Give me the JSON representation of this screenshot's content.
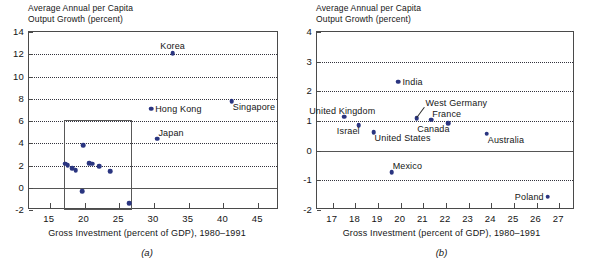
{
  "figure": {
    "ylabel": "Average Annual per Capita\nOutput Growth (percent)",
    "xlabel": "Gross Investment (percent of GDP), 1980–1991",
    "dot_color": "#2a3580",
    "frame_color": "#4a4a4a"
  },
  "panel_a": {
    "caption": "(a)",
    "ylabel": "Average Annual per Capita\nOutput Growth (percent)",
    "xlabel": "Gross Investment (percent of GDP), 1980–1991",
    "yticks": [
      14,
      12,
      10,
      8,
      6,
      4,
      2,
      0,
      -2
    ],
    "ytick_labels": [
      "14",
      "12",
      "10",
      "8",
      "6",
      "4",
      "2",
      "0",
      "-2"
    ],
    "xticks": [
      15,
      20,
      25,
      30,
      35,
      40,
      45
    ],
    "xtick_labels": [
      "15",
      "20",
      "25",
      "30",
      "35",
      "40",
      "45"
    ],
    "labels": [
      "Korea",
      "Hong Kong",
      "Singapore",
      "Japan"
    ]
  },
  "panel_b": {
    "caption": "(b)",
    "ylabel": "Average Annual per Capita\nOutput Growth (percent)",
    "xlabel": "Gross Investment (percent of GDP), 1980–1991",
    "yticks": [
      4,
      3,
      2,
      1,
      0,
      -1,
      -2
    ],
    "ytick_labels": [
      "4",
      "3",
      "2",
      "1",
      "0",
      "-1",
      "-2"
    ],
    "xticks": [
      17,
      18,
      19,
      20,
      21,
      22,
      23,
      24,
      25,
      26,
      27
    ],
    "xtick_labels": [
      "17",
      "18",
      "19",
      "20",
      "21",
      "22",
      "23",
      "24",
      "25",
      "26",
      "27"
    ],
    "labels": [
      "United Kingdom",
      "Israel",
      "United States",
      "India",
      "Mexico",
      "West Germany",
      "France",
      "Canada",
      "Australia",
      "Poland"
    ]
  },
  "chart_data": [
    {
      "type": "scatter",
      "panel": "(a)",
      "title": "",
      "xlabel": "Gross Investment (percent of GDP), 1980–1991",
      "ylabel": "Average Annual per Capita Output Growth (percent)",
      "xlim": [
        12.0,
        48.0
      ],
      "ylim": [
        -2,
        14
      ],
      "xticks": [
        15,
        20,
        25,
        30,
        35,
        40,
        45
      ],
      "yticks": [
        -2,
        0,
        2,
        4,
        6,
        8,
        10,
        12,
        14
      ],
      "grid": "horizontal-dotted",
      "legend": "none",
      "zero_line": 0,
      "highlight_box": {
        "x0": 17.0,
        "x1": 26.9,
        "y0": -2.0,
        "y1": 6.1
      },
      "points": [
        {
          "label": "Korea",
          "x": 32.7,
          "y": 12.1,
          "label_pos": "above"
        },
        {
          "label": "Singapore",
          "x": 41.2,
          "y": 7.8,
          "label_pos": "below-right"
        },
        {
          "label": "Hong Kong",
          "x": 29.6,
          "y": 7.1,
          "label_pos": "right"
        },
        {
          "label": "Japan",
          "x": 30.5,
          "y": 4.4,
          "label_pos": "above-right"
        },
        {
          "label": "",
          "x": 17.2,
          "y": 2.15,
          "label_pos": "none"
        },
        {
          "label": "",
          "x": 17.6,
          "y": 2.05,
          "label_pos": "none"
        },
        {
          "label": "",
          "x": 18.2,
          "y": 1.75,
          "label_pos": "none"
        },
        {
          "label": "",
          "x": 18.7,
          "y": 1.6,
          "label_pos": "none"
        },
        {
          "label": "",
          "x": 20.7,
          "y": 2.2,
          "label_pos": "none"
        },
        {
          "label": "",
          "x": 21.1,
          "y": 2.15,
          "label_pos": "none"
        },
        {
          "label": "",
          "x": 22.1,
          "y": 1.95,
          "label_pos": "none"
        },
        {
          "label": "",
          "x": 23.7,
          "y": 1.5,
          "label_pos": "none"
        },
        {
          "label": "",
          "x": 19.8,
          "y": 3.85,
          "label_pos": "none"
        },
        {
          "label": "",
          "x": 19.7,
          "y": -0.3,
          "label_pos": "none"
        },
        {
          "label": "",
          "x": 26.4,
          "y": -1.4,
          "label_pos": "none"
        }
      ]
    },
    {
      "type": "scatter",
      "panel": "(b)",
      "title": "",
      "xlabel": "Gross Investment (percent of GDP), 1980–1991",
      "ylabel": "Average Annual per Capita Output Growth (percent)",
      "xlim": [
        16.3,
        27.7
      ],
      "ylim": [
        -2,
        4
      ],
      "xticks": [
        17,
        18,
        19,
        20,
        21,
        22,
        23,
        24,
        25,
        26,
        27
      ],
      "yticks": [
        -2,
        -1,
        0,
        1,
        2,
        3,
        4
      ],
      "grid": "horizontal-dotted",
      "legend": "none",
      "zero_line": 0,
      "points": [
        {
          "label": "United Kingdom",
          "x": 17.5,
          "y": 1.15,
          "label_pos": "above-left"
        },
        {
          "label": "Israel",
          "x": 18.15,
          "y": 0.85,
          "label_pos": "below-left"
        },
        {
          "label": "United States",
          "x": 18.8,
          "y": 0.62,
          "label_pos": "below-right"
        },
        {
          "label": "India",
          "x": 19.9,
          "y": 2.32,
          "label_pos": "right"
        },
        {
          "label": "Mexico",
          "x": 19.6,
          "y": -0.72,
          "label_pos": "above-right"
        },
        {
          "label": "West Germany",
          "x": 20.7,
          "y": 1.1,
          "label_pos": "leader-above-right"
        },
        {
          "label": "France",
          "x": 21.35,
          "y": 1.05,
          "label_pos": "above-right"
        },
        {
          "label": "Canada",
          "x": 22.1,
          "y": 0.92,
          "label_pos": "below-left"
        },
        {
          "label": "Australia",
          "x": 23.8,
          "y": 0.57,
          "label_pos": "below-right"
        },
        {
          "label": "Poland",
          "x": 26.5,
          "y": -1.55,
          "label_pos": "left"
        }
      ]
    }
  ]
}
